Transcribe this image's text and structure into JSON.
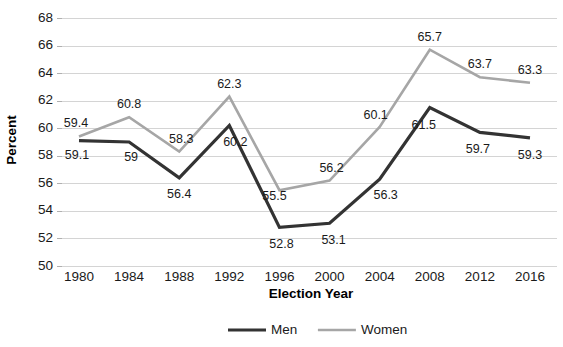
{
  "chart_data": {
    "type": "line",
    "title": "",
    "xlabel": "Election Year",
    "ylabel": "Percent",
    "categories": [
      "1980",
      "1984",
      "1988",
      "1992",
      "1996",
      "2000",
      "2004",
      "2008",
      "2012",
      "2016"
    ],
    "series": [
      {
        "name": "Men",
        "color": "#333333",
        "values": [
          59.1,
          59,
          56.4,
          60.2,
          52.8,
          53.1,
          56.3,
          61.5,
          59.7,
          59.3
        ],
        "labels": [
          "59.1",
          "59",
          "56.4",
          "60.2",
          "52.8",
          "53.1",
          "56.3",
          "61.5",
          "59.7",
          "59.3"
        ]
      },
      {
        "name": "Women",
        "color": "#a6a6a6",
        "values": [
          59.4,
          60.8,
          58.3,
          62.3,
          55.5,
          56.2,
          60.1,
          65.7,
          63.7,
          63.3
        ],
        "labels": [
          "59.4",
          "60.8",
          "58.3",
          "62.3",
          "55.5",
          "56.2",
          "60.1",
          "65.7",
          "63.7",
          "63.3"
        ]
      }
    ],
    "ylim": [
      50,
      68
    ],
    "ytick_step": 2,
    "yticks": [
      "50",
      "52",
      "54",
      "56",
      "58",
      "60",
      "62",
      "64",
      "66",
      "68"
    ],
    "grid": true,
    "legend_position": "bottom",
    "gridcolor": "#d4d4d4",
    "background": "#ffffff"
  },
  "legend": {
    "items": [
      {
        "label": "Men",
        "color": "#333333"
      },
      {
        "label": "Women",
        "color": "#a6a6a6"
      }
    ]
  }
}
